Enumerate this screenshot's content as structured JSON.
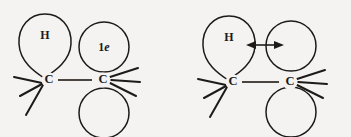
{
  "figure": {
    "background_color": "#f4f3f1",
    "line_color": "#1d1a18",
    "bond_color": "#4a4540",
    "structures": [
      {
        "id": "structure-left",
        "name": "ethyl-radical-orbital-left",
        "atoms": [
          {
            "id": "left-carbon",
            "label": "C"
          },
          {
            "id": "right-carbon",
            "label": "C"
          }
        ],
        "lobes": [
          {
            "id": "hydrogen-lobe",
            "label": "H",
            "shape": "teardrop"
          },
          {
            "id": "single-electron-lobe",
            "label_prefix": "1",
            "label_italic": "e",
            "shape": "circle"
          },
          {
            "id": "lower-lobe",
            "label": "",
            "shape": "circle"
          }
        ],
        "arrow": null
      },
      {
        "id": "structure-right",
        "name": "ethyl-radical-orbital-right",
        "atoms": [
          {
            "id": "left-carbon",
            "label": "C"
          },
          {
            "id": "right-carbon",
            "label": "C"
          }
        ],
        "lobes": [
          {
            "id": "hydrogen-lobe",
            "label": "H",
            "shape": "teardrop"
          },
          {
            "id": "upper-right-lobe",
            "label": "",
            "shape": "circle"
          },
          {
            "id": "lower-lobe",
            "label": "",
            "shape": "circle"
          }
        ],
        "arrow": {
          "id": "hyperconjugation-arrow",
          "type": "double-headed-horizontal",
          "label": ""
        }
      }
    ]
  }
}
